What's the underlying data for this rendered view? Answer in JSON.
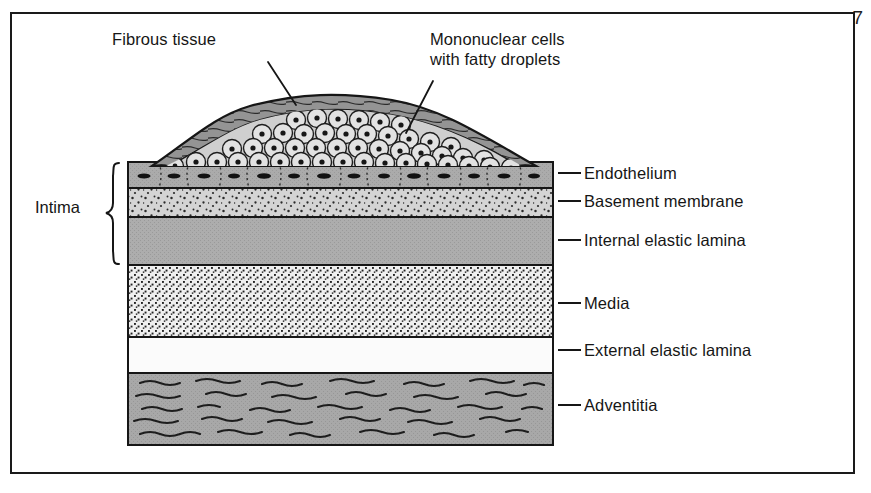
{
  "page": {
    "number": "7",
    "width": 871,
    "height": 493,
    "background": "#ffffff",
    "frame_color": "#1a1a1a"
  },
  "figure": {
    "kind": "medical-illustration",
    "colors": {
      "ink": "#161616",
      "endothelium_fill": "#a9a9a9",
      "basement_membrane_fill": "#d2d2d2",
      "internal_elastic_lamina_fill": "#ababab",
      "media_fill": "#ededed",
      "external_elastic_lamina_fill": "#fbfbfb",
      "adventitia_fill": "#a6a6a6",
      "plaque_cap_fill": "#8f8f8f",
      "foam_cell_fill": "#d8d8d8"
    },
    "block": {
      "left": 128,
      "right": 553,
      "top": 162,
      "bottom": 445
    }
  },
  "top_callouts": [
    {
      "id": "fibrous-tissue",
      "lines": [
        "Fibrous tissue"
      ],
      "text_x": 112,
      "text_y": 38,
      "leader": {
        "x1": 268,
        "y1": 62,
        "x2": 295,
        "y2": 104
      }
    },
    {
      "id": "mononuclear-cells",
      "lines": [
        "Mononuclear cells",
        "with fatty droplets"
      ],
      "text_x": 430,
      "text_y": 38,
      "leader": {
        "x1": 432,
        "y1": 80,
        "x2": 405,
        "y2": 132
      }
    }
  ],
  "side_labels": [
    {
      "id": "endothelium",
      "label": "Endothelium",
      "y": 173,
      "leader_x1": 558,
      "leader_x2": 581,
      "text_x": 584
    },
    {
      "id": "basement-membrane",
      "label": "Basement membrane",
      "y": 201,
      "leader_x1": 558,
      "leader_x2": 581,
      "text_x": 584
    },
    {
      "id": "internal-elastic-lamina",
      "label": "Internal elastic lamina",
      "y": 240,
      "leader_x1": 558,
      "leader_x2": 581,
      "text_x": 584
    },
    {
      "id": "media",
      "label": "Media",
      "y": 303,
      "leader_x1": 558,
      "leader_x2": 581,
      "text_x": 584
    },
    {
      "id": "external-elastic-lamina",
      "label": "External elastic lamina",
      "y": 350,
      "leader_x1": 558,
      "leader_x2": 581,
      "text_x": 584
    },
    {
      "id": "adventitia",
      "label": "Adventitia",
      "y": 405,
      "leader_x1": 558,
      "leader_x2": 581,
      "text_x": 584
    }
  ],
  "bracket": {
    "label": "Intima",
    "label_x": 35,
    "label_y": 198,
    "top": 162,
    "bottom": 265,
    "x": 113
  },
  "layers": [
    {
      "id": "endothelium",
      "name": "Endothelium",
      "top": 162,
      "bottom": 188,
      "fill": "#a9a9a9",
      "texture": "endothelial-cells-with-nuclei"
    },
    {
      "id": "basement-membrane",
      "name": "Basement membrane",
      "top": 188,
      "bottom": 217,
      "fill": "#d2d2d2",
      "texture": "coarse-stipple"
    },
    {
      "id": "internal-elastic-lamina",
      "name": "Internal elastic lamina",
      "top": 217,
      "bottom": 265,
      "fill": "#ababab",
      "texture": "flat-gray"
    },
    {
      "id": "media",
      "name": "Media",
      "top": 265,
      "bottom": 337,
      "fill": "#ededed",
      "texture": "dense-fine-stipple"
    },
    {
      "id": "external-elastic-lamina",
      "name": "External elastic lamina",
      "top": 337,
      "bottom": 373,
      "fill": "#fbfbfb",
      "texture": "blank"
    },
    {
      "id": "adventitia",
      "name": "Adventitia",
      "top": 373,
      "bottom": 445,
      "fill": "#a6a6a6",
      "texture": "wavy-collagen-fibers"
    }
  ],
  "plaque": {
    "name": "Atherosclerotic plaque",
    "apex_y": 101,
    "left_x": 152,
    "right_x": 536,
    "cap_label": "Fibrous tissue",
    "core_label": "Mononuclear cells with fatty droplets",
    "foam_cell_count": 96
  }
}
